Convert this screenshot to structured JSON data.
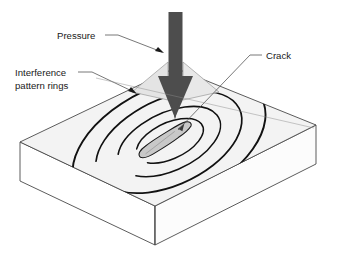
{
  "figure": {
    "background_color": "#ffffff",
    "width": 337,
    "height": 260
  },
  "labels": {
    "pressure": "Pressure",
    "interference_line1": "Interference",
    "interference_line2": "pattern rings",
    "crack": "Crack"
  },
  "colors": {
    "outline": "#1a1a1a",
    "slab_top": "#f2f2f2",
    "slab_front_left": "#ffffff",
    "slab_front_right": "#fbfbfb",
    "arrow_shaft": "#4a4a4a",
    "arrow_wing": "#e2e2e2",
    "crack_fill": "#c8c8c8",
    "ring_stroke": "#111111",
    "leader_line": "#555555",
    "text": "#1a1a1a"
  },
  "geometry": {
    "slab": {
      "top_face_points": "20,142 175,68 316,125 155,206",
      "front_left_points": "20,142 155,206 155,245 20,181",
      "front_right_points": "155,206 316,125 316,164 155,245",
      "description": "isometric rectangular slab"
    },
    "rings": {
      "center_x": 170,
      "center_y": 140,
      "rotation_deg": -25,
      "count": 4,
      "radii_rx": [
        103,
        78,
        55,
        36
      ],
      "radii_ry": [
        58,
        43,
        29,
        18
      ],
      "open_gap": true
    },
    "crack": {
      "center_x": 163,
      "center_y": 141,
      "path": "irregular elongated blob",
      "rotation_deg": -25
    },
    "arrow": {
      "shaft_x": 175,
      "shaft_top_y": 12,
      "shaft_width": 13,
      "head_tip_y": 118,
      "head_half_width": 17
    },
    "leaders": {
      "pressure_from": [
        112,
        36
      ],
      "pressure_to": [
        168,
        58
      ],
      "interference_from": [
        90,
        72
      ],
      "interference_to": [
        141,
        96
      ],
      "crack_from": [
        248,
        55
      ],
      "crack_to": [
        175,
        128
      ]
    }
  }
}
